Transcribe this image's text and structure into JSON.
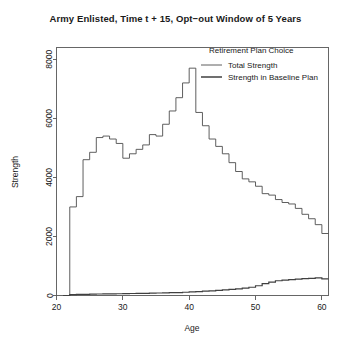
{
  "chart_data": {
    "type": "line",
    "title": "Army Enlisted, Time t + 15, Opt−out Window of 5 Years",
    "xlabel": "Age",
    "ylabel": "Strength",
    "xlim": [
      20,
      61
    ],
    "ylim": [
      0,
      8400
    ],
    "xticks": [
      20,
      30,
      40,
      50,
      60
    ],
    "yticks": [
      0,
      2000,
      4000,
      6000,
      8000
    ],
    "xticklabels": [
      "20",
      "30",
      "40",
      "50",
      "60"
    ],
    "yticklabels": [
      "0",
      "2000",
      "4000",
      "6000",
      "8000"
    ],
    "grid": false,
    "step_style": "post",
    "legend": {
      "title": "Retirement Plan Choice",
      "position": "top-right-inside",
      "entries": [
        {
          "name": "Total Strength",
          "color": "#4d4d4d",
          "width": 0.9
        },
        {
          "name": "Strength in Baseline Plan",
          "color": "#404040",
          "width": 1.4
        }
      ]
    },
    "x": [
      21,
      22,
      23,
      24,
      25,
      26,
      27,
      28,
      29,
      30,
      31,
      32,
      33,
      34,
      35,
      36,
      37,
      38,
      39,
      40,
      41,
      42,
      43,
      44,
      45,
      46,
      47,
      48,
      49,
      50,
      51,
      52,
      53,
      54,
      55,
      56,
      57,
      58,
      59,
      60
    ],
    "series": [
      {
        "name": "Total Strength",
        "color": "#4d4d4d",
        "values": [
          0,
          3000,
          3350,
          4600,
          4850,
          5350,
          5400,
          5300,
          5150,
          4650,
          4800,
          4950,
          5100,
          5450,
          5400,
          5800,
          6250,
          6700,
          7200,
          7700,
          6200,
          5750,
          5300,
          5050,
          4800,
          4500,
          4200,
          3950,
          3850,
          3700,
          3450,
          3400,
          3250,
          3150,
          3100,
          2950,
          2750,
          2600,
          2400,
          2100
        ]
      },
      {
        "name": "Strength in Baseline Plan",
        "color": "#404040",
        "values": [
          0,
          30,
          35,
          40,
          45,
          50,
          55,
          58,
          60,
          65,
          68,
          72,
          75,
          80,
          85,
          90,
          95,
          100,
          110,
          120,
          130,
          145,
          160,
          175,
          190,
          205,
          225,
          250,
          280,
          330,
          400,
          450,
          500,
          520,
          540,
          555,
          570,
          580,
          600,
          560
        ]
      }
    ]
  },
  "figure": {
    "background": "#ffffff",
    "axis_color": "#555555",
    "text_color": "#1a1a1a"
  }
}
